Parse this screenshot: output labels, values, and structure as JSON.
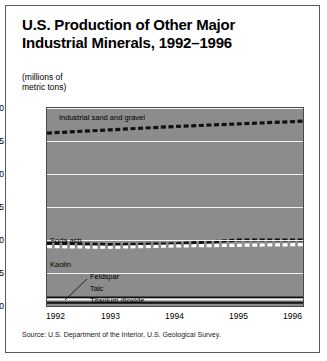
{
  "figure": {
    "title": "U.S. Production of Other Major Industrial Minerals, 1992–1996",
    "title_line1": "U.S. Production of Other Major",
    "title_line2": "Industrial Minerals, 1992–1996",
    "units_line1": "(millions of",
    "units_line2": "metric tons)",
    "source": "Source: U.S. Department of the Interior, U.S. Geological Survey."
  },
  "colors": {
    "plot_background": "#8c8c8c",
    "gridline": "#f2f2f2",
    "frame": "#5a5a5a",
    "series_dark": "#111111",
    "series_light": "#ffffff",
    "text": "#000000"
  },
  "chart_data": {
    "type": "line",
    "title": "U.S. Production of Other Major Industrial Minerals, 1992–1996",
    "xlabel": "",
    "ylabel": "(millions of metric tons)",
    "x": [
      1992,
      1993,
      1994,
      1995,
      1996
    ],
    "xticklabels": [
      "1992",
      "1993",
      "1994",
      "1995",
      "1996"
    ],
    "yticks": [
      0,
      5,
      10,
      15,
      20,
      25,
      30
    ],
    "yticklabels": [
      "0",
      "5",
      "10",
      "15",
      "20",
      "25",
      "30"
    ],
    "ylim": [
      0,
      30
    ],
    "xlim": [
      1992,
      1996
    ],
    "grid": "horizontal",
    "legend": "inline-labels",
    "series": [
      {
        "name": "Industrial sand and gravel",
        "style": "dashed-dark",
        "values": [
          26.2,
          26.7,
          27.2,
          27.6,
          28.0
        ]
      },
      {
        "name": "Soda ash",
        "style": "dashed-dark",
        "values": [
          9.5,
          9.3,
          9.4,
          10.0,
          10.0
        ]
      },
      {
        "name": "Kaolin",
        "style": "dashed-light",
        "values": [
          9.0,
          8.9,
          9.1,
          9.2,
          9.3
        ]
      },
      {
        "name": "Feldspar",
        "style": "solid-dark",
        "values": [
          1.3,
          1.3,
          1.3,
          1.3,
          1.3
        ]
      },
      {
        "name": "Talc",
        "style": "solid-light",
        "values": [
          1.0,
          1.0,
          1.0,
          1.0,
          1.0
        ]
      },
      {
        "name": "Titanium dioxide",
        "style": "solid-dark",
        "values": [
          0.5,
          0.5,
          0.5,
          0.5,
          0.5
        ]
      }
    ],
    "annotations": [
      {
        "text": "Industrial sand and gravel",
        "series": "Industrial sand and gravel"
      },
      {
        "text": "Soda ash",
        "series": "Soda ash"
      },
      {
        "text": "Kaolin",
        "series": "Kaolin"
      },
      {
        "text": "Feldspar",
        "series": "Feldspar",
        "leader": true
      },
      {
        "text": "Talc",
        "series": "Talc"
      },
      {
        "text": "Titanium dioxide",
        "series": "Titanium dioxide"
      }
    ]
  }
}
